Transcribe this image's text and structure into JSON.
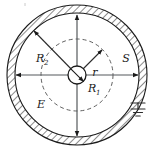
{
  "figure": {
    "kind": "cross-section-diagram",
    "background_color": "#ffffff",
    "line_color": "#1a1a1a",
    "dash_color": "#4d4d4d",
    "hatch_color": "#2b2b2b",
    "geometry": {
      "center_x": 77,
      "center_y": 75,
      "shell_outer_radius": 70,
      "shell_inner_radius": 62,
      "gaussian_dashed_radius": 36,
      "inner_conductor_radius": 9
    },
    "labels": {
      "shell_label": "S",
      "field_label": "E",
      "gaussian_radius_label": "r",
      "inner_radius_label": "R",
      "inner_radius_subscript": "1",
      "shell_inner_radius_label": "R",
      "shell_inner_radius_subscript": "2"
    },
    "symbols": {
      "ground": "earth-ground",
      "ground_bar_widths": [
        14,
        9,
        5
      ]
    },
    "dimension_arrows": [
      {
        "name": "up-arrow",
        "from": "center",
        "to": "shell-inner-top"
      },
      {
        "name": "down-arrow",
        "from": "center",
        "to": "shell-inner-bottom"
      },
      {
        "name": "left-arrow",
        "from": "center",
        "to": "shell-inner-left"
      },
      {
        "name": "right-arrow",
        "from": "center",
        "to": "shell-inner-right"
      },
      {
        "name": "r-arrow",
        "from": "center",
        "to": "gaussian-surface"
      },
      {
        "name": "R2-arrow",
        "from": "center",
        "to": "shell-inner-upper-left"
      },
      {
        "name": "R1-arrow",
        "from": "center",
        "to": "inner-conductor-edge"
      }
    ]
  }
}
